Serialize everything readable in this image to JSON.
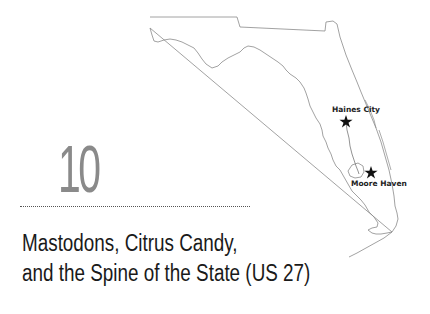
{
  "chapter": {
    "number": "10",
    "title_line1": "Mastodons, Citrus Candy,",
    "title_line2": "and the Spine of the State (US 27)"
  },
  "map": {
    "region": "Florida",
    "route_color": "#777777",
    "outline_color": "#8a8a8a",
    "markers": [
      {
        "label": "Haines City",
        "icon": "star-icon"
      },
      {
        "label": "Moore Haven",
        "icon": "star-icon"
      }
    ]
  }
}
